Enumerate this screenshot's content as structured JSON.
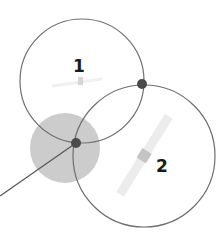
{
  "diagram": {
    "colors": {
      "background": "#ffffff",
      "circle_stroke": "#6e6e6e",
      "shaded_area": "#cccccc",
      "intersection_dot": "#4a4a4a",
      "satellite_body": "#c4c4c4",
      "satellite_panel": "#ececec",
      "label": "#1a1a1a"
    },
    "circles": [
      {
        "id": "1",
        "label": "1",
        "cx": 82,
        "cy": 81,
        "r": 62
      },
      {
        "id": "2",
        "label": "2",
        "cx": 144,
        "cy": 156,
        "r": 71
      }
    ],
    "shaded_region": {
      "cx": 65,
      "cy": 148,
      "r": 35
    },
    "intersections": [
      {
        "x": 142,
        "y": 84
      },
      {
        "x": 76,
        "y": 143
      }
    ],
    "pointer_line": {
      "x1": 76,
      "y1": 143,
      "x2": 0,
      "y2": 196
    },
    "labels": {
      "satellite_1": "1",
      "satellite_2": "2"
    }
  }
}
